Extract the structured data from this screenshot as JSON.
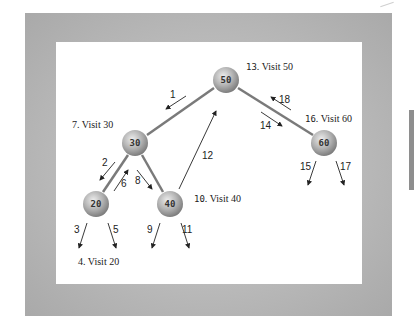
{
  "diagram": {
    "type": "binary-tree-inorder-traversal",
    "nodes": [
      {
        "id": "n50",
        "value": "50",
        "x": 226,
        "y": 80
      },
      {
        "id": "n30",
        "value": "30",
        "x": 135,
        "y": 143
      },
      {
        "id": "n60",
        "value": "60",
        "x": 324,
        "y": 143
      },
      {
        "id": "n20",
        "value": "20",
        "x": 96,
        "y": 204
      },
      {
        "id": "n40",
        "value": "40",
        "x": 170,
        "y": 204
      }
    ],
    "edges": [
      {
        "from": "50",
        "to": "30"
      },
      {
        "from": "50",
        "to": "60"
      },
      {
        "from": "30",
        "to": "20"
      },
      {
        "from": "30",
        "to": "40"
      }
    ],
    "visit_labels": [
      {
        "step": "13",
        "text": "Visit 50"
      },
      {
        "step": "7",
        "text": "Visit 30"
      },
      {
        "step": "16",
        "text": "Visit 60"
      },
      {
        "step": "10",
        "text": "Visit 40"
      },
      {
        "step": "4",
        "text": "Visit 20"
      }
    ],
    "step_numbers": [
      "1",
      "2",
      "3",
      "5",
      "6",
      "8",
      "9",
      "11",
      "12",
      "14",
      "15",
      "17",
      "18"
    ],
    "colors": {
      "frame": "#b8b8b8",
      "panel": "#ffffff",
      "edge": "#7a7a7a",
      "node_light": "#e6e6e6",
      "node_dark": "#8a8a8a",
      "arrow": "#222222"
    }
  }
}
